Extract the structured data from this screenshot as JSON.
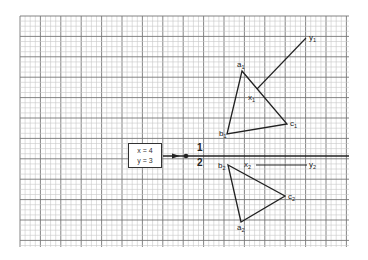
{
  "grid": {
    "left": 20,
    "top": 16,
    "right": 349,
    "bottom": 247,
    "minor_step": 5.1,
    "major_every": 4,
    "minor_color": "#c8c8c8",
    "major_color": "#777777"
  },
  "input_box": {
    "line1": "x = 4",
    "line2": "y = 3"
  },
  "split_labels": {
    "top": "1",
    "bottom": "2"
  },
  "figure1": {
    "points": {
      "a": {
        "label": "a",
        "sub": "1",
        "x": 242,
        "y": 71
      },
      "b": {
        "label": "b",
        "sub": "1",
        "x": 227,
        "y": 134
      },
      "c": {
        "label": "c",
        "sub": "1",
        "x": 287,
        "y": 124
      },
      "x": {
        "label": "x",
        "sub": "1",
        "x": 257,
        "y": 89
      },
      "y": {
        "label": "y",
        "sub": "1",
        "x": 306,
        "y": 38
      }
    }
  },
  "figure2": {
    "points": {
      "a": {
        "label": "a",
        "sub": "2",
        "x": 241,
        "y": 222
      },
      "b": {
        "label": "b",
        "sub": "2",
        "x": 228,
        "y": 165
      },
      "c": {
        "label": "c",
        "sub": "2",
        "x": 285,
        "y": 196
      },
      "x": {
        "label": "x",
        "sub": "2",
        "x": 253,
        "y": 165
      },
      "y": {
        "label": "y",
        "sub": "2",
        "x": 308,
        "y": 165
      }
    }
  },
  "line_color": "#222222"
}
